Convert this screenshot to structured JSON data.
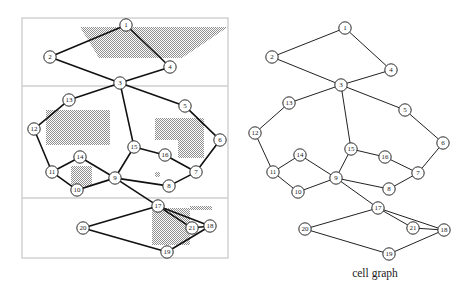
{
  "figure": {
    "caption": "cell graph",
    "node_labels": [
      "1",
      "2",
      "3",
      "4",
      "5",
      "6",
      "7",
      "8",
      "9",
      "10",
      "11",
      "12",
      "13",
      "14",
      "15",
      "16",
      "17",
      "18",
      "19",
      "20",
      "21"
    ],
    "colors": {
      "shading": "#8f8f8f",
      "edge": "#111111",
      "node_stroke": "#2a2a2a",
      "node_fill": "#ffffff",
      "frame": "#cfcfcf",
      "text": "#1a1a1a",
      "background": "#ffffff"
    }
  },
  "chart_data": {
    "type": "diagram",
    "title": "",
    "subtitle": "",
    "caption": "cell graph",
    "panels": [
      {
        "name": "floorplan-layout",
        "label": "",
        "frame": {
          "x": 22,
          "y": 18,
          "width": 206,
          "height": 240
        },
        "dividers_y": [
          86,
          198
        ],
        "shaded_regions": [
          {
            "name": "top-trapezoid",
            "points": "80,27 228,27 182,58 99,58"
          },
          {
            "name": "mid-left-rect",
            "points": "46,110 110,110 110,145 46,145"
          },
          {
            "name": "mid-right-L",
            "points": "155,118 204,118 204,158 178,158 178,140 155,140"
          },
          {
            "name": "small-square-near-10",
            "points": "71,166 92,166 92,186 71,186"
          },
          {
            "name": "tiny-dot-near-8",
            "points": "155,172 160,172 160,177 155,177"
          },
          {
            "name": "bottom-rect",
            "points": "152,208 190,208 190,245 152,245"
          },
          {
            "name": "bottom-strip-near-21",
            "points": "190,206 212,206 212,210 190,210"
          }
        ]
      },
      {
        "name": "cell-graph",
        "label": "cell graph",
        "frame": null,
        "dividers_y": [],
        "shaded_regions": []
      }
    ],
    "nodes_left": [
      {
        "id": "1",
        "x": 126,
        "y": 25
      },
      {
        "id": "2",
        "x": 50,
        "y": 57
      },
      {
        "id": "3",
        "x": 120,
        "y": 83
      },
      {
        "id": "4",
        "x": 170,
        "y": 67
      },
      {
        "id": "5",
        "x": 185,
        "y": 106
      },
      {
        "id": "6",
        "x": 220,
        "y": 140
      },
      {
        "id": "7",
        "x": 196,
        "y": 172
      },
      {
        "id": "8",
        "x": 169,
        "y": 186
      },
      {
        "id": "9",
        "x": 115,
        "y": 178
      },
      {
        "id": "10",
        "x": 77,
        "y": 190
      },
      {
        "id": "11",
        "x": 52,
        "y": 172
      },
      {
        "id": "12",
        "x": 34,
        "y": 129
      },
      {
        "id": "13",
        "x": 69,
        "y": 100
      },
      {
        "id": "14",
        "x": 80,
        "y": 157
      },
      {
        "id": "15",
        "x": 134,
        "y": 147
      },
      {
        "id": "16",
        "x": 165,
        "y": 155
      },
      {
        "id": "17",
        "x": 158,
        "y": 206
      },
      {
        "id": "18",
        "x": 210,
        "y": 226
      },
      {
        "id": "19",
        "x": 167,
        "y": 252
      },
      {
        "id": "20",
        "x": 83,
        "y": 228
      },
      {
        "id": "21",
        "x": 192,
        "y": 228
      }
    ],
    "nodes_right": [
      {
        "id": "1",
        "x": 345,
        "y": 28
      },
      {
        "id": "2",
        "x": 272,
        "y": 57
      },
      {
        "id": "3",
        "x": 341,
        "y": 85
      },
      {
        "id": "4",
        "x": 391,
        "y": 70
      },
      {
        "id": "5",
        "x": 405,
        "y": 110
      },
      {
        "id": "6",
        "x": 443,
        "y": 143
      },
      {
        "id": "7",
        "x": 418,
        "y": 173
      },
      {
        "id": "8",
        "x": 389,
        "y": 189
      },
      {
        "id": "9",
        "x": 336,
        "y": 178
      },
      {
        "id": "10",
        "x": 298,
        "y": 192
      },
      {
        "id": "11",
        "x": 273,
        "y": 172
      },
      {
        "id": "12",
        "x": 255,
        "y": 133
      },
      {
        "id": "13",
        "x": 289,
        "y": 103
      },
      {
        "id": "14",
        "x": 300,
        "y": 155
      },
      {
        "id": "15",
        "x": 351,
        "y": 149
      },
      {
        "id": "16",
        "x": 385,
        "y": 157
      },
      {
        "id": "17",
        "x": 378,
        "y": 208
      },
      {
        "id": "18",
        "x": 444,
        "y": 230
      },
      {
        "id": "19",
        "x": 389,
        "y": 254
      },
      {
        "id": "20",
        "x": 305,
        "y": 229
      },
      {
        "id": "21",
        "x": 413,
        "y": 228
      }
    ],
    "edges": [
      [
        "1",
        "2"
      ],
      [
        "1",
        "4"
      ],
      [
        "2",
        "3"
      ],
      [
        "3",
        "4"
      ],
      [
        "3",
        "13"
      ],
      [
        "3",
        "15"
      ],
      [
        "3",
        "5"
      ],
      [
        "5",
        "6"
      ],
      [
        "6",
        "7"
      ],
      [
        "7",
        "8"
      ],
      [
        "7",
        "16"
      ],
      [
        "8",
        "9"
      ],
      [
        "9",
        "15"
      ],
      [
        "15",
        "16"
      ],
      [
        "13",
        "12"
      ],
      [
        "12",
        "11"
      ],
      [
        "11",
        "14"
      ],
      [
        "11",
        "10"
      ],
      [
        "14",
        "9"
      ],
      [
        "10",
        "9"
      ],
      [
        "9",
        "17"
      ],
      [
        "17",
        "20"
      ],
      [
        "17",
        "21"
      ],
      [
        "17",
        "18"
      ],
      [
        "20",
        "19"
      ],
      [
        "19",
        "18"
      ],
      [
        "21",
        "18"
      ]
    ]
  }
}
